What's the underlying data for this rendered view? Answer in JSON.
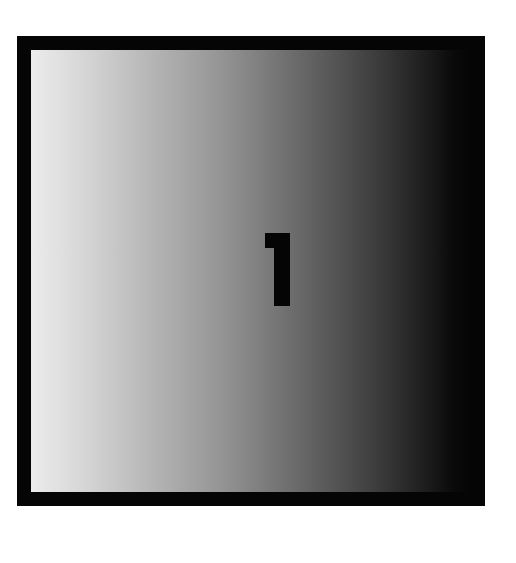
{
  "tile": {
    "label": "1",
    "label_color": "#050505",
    "frame_color": "#050505",
    "gradient_start": "#ececec",
    "gradient_end": "#050505"
  }
}
